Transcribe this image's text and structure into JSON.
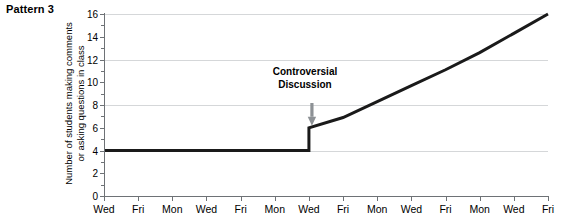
{
  "figure": {
    "pattern_label": "Pattern 3"
  },
  "annotation": {
    "line1": "Controversial",
    "line2": "Discussion",
    "arrow": "down-arrow-icon"
  },
  "chart_data": {
    "type": "line",
    "title": "Pattern 3",
    "xlabel": "",
    "ylabel_line1": "Number of students making comments",
    "ylabel_line2": "or asking questions in class",
    "ylabel": "Number of students making comments or asking questions in class",
    "categories": [
      "Wed",
      "Fri",
      "Mon",
      "Wed",
      "Fri",
      "Mon",
      "Wed",
      "Fri",
      "Mon",
      "Wed",
      "Fri",
      "Mon",
      "Wed",
      "Fri"
    ],
    "x": [
      0,
      1,
      2,
      3,
      4,
      5,
      6,
      7,
      8,
      9,
      10,
      11,
      12,
      13
    ],
    "values": [
      4,
      4,
      4,
      4,
      4,
      4,
      6,
      6.9,
      8.3,
      9.7,
      11.1,
      12.6,
      14.3,
      16
    ],
    "step_at_index": 6,
    "step_from": 4,
    "step_to": 6,
    "ylim": [
      0,
      16
    ],
    "ytick_labels": [
      "0",
      "2",
      "4",
      "6",
      "8",
      "10",
      "12",
      "14",
      "16"
    ],
    "ytick_values": [
      0,
      2,
      4,
      6,
      8,
      10,
      12,
      14,
      16
    ],
    "yminor_values": [
      1,
      3,
      5,
      7,
      9,
      11,
      13,
      15
    ],
    "gridlines": [
      4,
      8,
      12,
      16
    ],
    "grid": true,
    "legend": "none",
    "annotations": [
      {
        "text": "Controversial Discussion",
        "points_to_x_index": 6,
        "points_to_y": 6
      }
    ],
    "line_color": "#1a1a1a",
    "grid_color": "#d5d7d9",
    "axis_color": "#6e7276"
  }
}
